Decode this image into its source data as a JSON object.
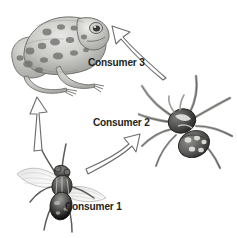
{
  "diagram": {
    "background_color": "#ffffff",
    "label_color": "#231f20",
    "arrow_outline_color": "#6d6e71",
    "arrow_fill_color": "#ffffff",
    "labels": {
      "consumer_1": "Consumer 1",
      "consumer_2": "Consumer 2",
      "consumer_3": "Consumer 3"
    },
    "organisms": [
      {
        "name": "fly",
        "icon": "fly-illustration",
        "label": "Consumer 1",
        "position": "bottom-left"
      },
      {
        "name": "spider",
        "icon": "spider-illustration",
        "label": "Consumer 2",
        "position": "right"
      },
      {
        "name": "frog",
        "icon": "frog-illustration",
        "label": "Consumer 3",
        "position": "top-left"
      }
    ],
    "arrows": [
      {
        "name": "fly-to-spider",
        "icon": "arrow-up-right-icon",
        "from": "fly",
        "to": "spider",
        "style": "outlined-curved"
      },
      {
        "name": "spider-to-frog",
        "icon": "arrow-up-left-icon",
        "from": "spider",
        "to": "frog",
        "style": "outlined-curved"
      },
      {
        "name": "fly-to-frog",
        "icon": "arrow-up-icon",
        "from": "fly",
        "to": "frog",
        "style": "outlined-straight"
      }
    ]
  }
}
